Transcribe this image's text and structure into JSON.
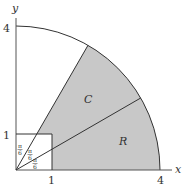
{
  "diagram": {
    "axes": {
      "x_label": "x",
      "y_label": "y",
      "x_ticks": [
        "1",
        "4"
      ],
      "y_ticks": [
        "1",
        "4"
      ]
    },
    "regions": {
      "upper_sector_label": "C",
      "lower_sector_label": "R"
    },
    "angle_labels": {
      "a1_num": "π",
      "a1_den": "6",
      "a2_num": "π",
      "a2_den": "6",
      "a3_num": "π",
      "a3_den": "6"
    },
    "colors": {
      "shade": "#c8c8c8",
      "stroke": "#333333"
    }
  }
}
